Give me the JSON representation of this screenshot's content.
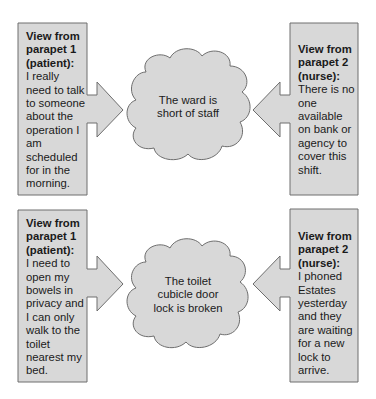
{
  "colors": {
    "fill": "#d8d8d8",
    "stroke": "#6e6e6e",
    "text": "#1a1a1a",
    "background": "#ffffff"
  },
  "rows": [
    {
      "left": {
        "heading": "View from parapet 1 (patient):",
        "body": "I really need to talk to someone about the operation I am scheduled for in the morning."
      },
      "center": {
        "text": "The ward is short of staff"
      },
      "right": {
        "heading": "View from parapet 2 (nurse):",
        "body": "There is no one available on bank or agency to cover this shift."
      }
    },
    {
      "left": {
        "heading": "View from parapet 1 (patient):",
        "body": "I need to open my bowels in privacy and I can only walk to the toilet nearest my bed."
      },
      "center": {
        "text": "The toilet cubicle door lock is broken"
      },
      "right": {
        "heading": "View from parapet 2 (nurse):",
        "body": "I phoned Estates yesterday and they are waiting for a new lock to arrive."
      }
    }
  ]
}
